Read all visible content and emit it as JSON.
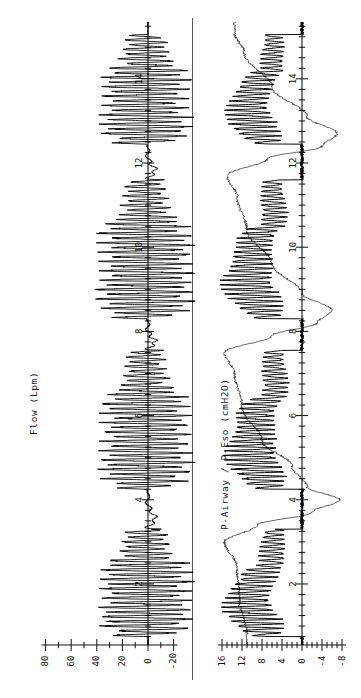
{
  "figure": {
    "orientation": "rotated-90-ccw",
    "background": "#ffffff",
    "ink_color": "#000000"
  },
  "panels": {
    "flow": {
      "axis_title": "Flow (Lpm)",
      "value_ticks": [
        "80",
        "60",
        "40",
        "20",
        "0",
        "-20"
      ],
      "time_ticks": [
        "2",
        "4",
        "6",
        "8",
        "10",
        "12",
        "14"
      ]
    },
    "pressure": {
      "axis_title": "P-Airway / P-Eso (cmH2O)",
      "value_ticks": [
        "16",
        "12",
        "8",
        "4",
        "0",
        "-4",
        "-8"
      ],
      "time_ticks": [
        "2",
        "4",
        "6",
        "8",
        "10",
        "12",
        "14"
      ]
    }
  },
  "chart_data": {
    "type": "line",
    "title": "",
    "subtitle": "",
    "layout": "two stacked panels, rendered rotated 90 degrees counter-clockwise; time axis runs bottom-to-top",
    "xlabel": "Time (s)",
    "xlim": [
      0.6,
      15.2
    ],
    "grid": false,
    "legend_position": "none",
    "panels": [
      {
        "name": "flow",
        "ylabel": "Flow (Lpm)",
        "yunits": "Lpm",
        "ylim": [
          -25,
          90
        ],
        "ytick_values": [
          80,
          60,
          40,
          20,
          0,
          -20
        ],
        "ytick_labels": [
          "80",
          "60",
          "40",
          "20",
          "0",
          "-20"
        ],
        "yminor_step": 10,
        "xtick_values": [
          2,
          4,
          6,
          8,
          10,
          12,
          14
        ],
        "xtick_labels": [
          "2",
          "4",
          "6",
          "8",
          "10",
          "12",
          "14"
        ],
        "xminor_step": 0.25,
        "series": [
          {
            "name": "Flow",
            "style": "solid",
            "linewidth": 0.9,
            "description": "high-frequency oscillatory flow; four oscillation bursts separated by quiet baseline intervals with transient spikes",
            "bursts": [
              {
                "t_start": 0.75,
                "t_end": 3.3,
                "carrier_hz": 9.0,
                "amp_low": 34,
                "amp_high": 76,
                "offset": 2
              },
              {
                "t_start": 4.25,
                "t_end": 7.55,
                "carrier_hz": 9.0,
                "amp_low": 30,
                "amp_high": 74,
                "offset": 2
              },
              {
                "t_start": 8.3,
                "t_end": 11.6,
                "carrier_hz": 9.0,
                "amp_low": 32,
                "amp_high": 78,
                "offset": 2
              },
              {
                "t_start": 12.45,
                "t_end": 15.05,
                "carrier_hz": 9.0,
                "amp_low": 34,
                "amp_high": 72,
                "offset": 2
              }
            ],
            "quiet_segments": [
              {
                "t_start": 3.3,
                "t_end": 4.25,
                "baseline": 0,
                "features": "slow downward excursion to about -6 then recovery with a sharp negative spike near t=4.1"
              },
              {
                "t_start": 7.55,
                "t_end": 8.3,
                "baseline": 0,
                "features": "brief ripple around -4 to +6 with a sharp spike at t=7.6"
              },
              {
                "t_start": 11.6,
                "t_end": 12.45,
                "baseline": 0,
                "features": "oscillatory decay from +10 to 0, sharp spike near t=12.4"
              }
            ]
          }
        ]
      },
      {
        "name": "pressure",
        "ylabel": "P-Airway / P-Eso (cmH2O)",
        "yunits": "cmH2O",
        "ylim": [
          -10,
          18
        ],
        "ytick_values": [
          16,
          12,
          8,
          4,
          0,
          -4,
          -8
        ],
        "ytick_labels": [
          "16",
          "12",
          "8",
          "4",
          "0",
          "-4",
          "-8"
        ],
        "yminor_step": 1,
        "xtick_values": [
          2,
          4,
          6,
          8,
          10,
          12,
          14
        ],
        "xtick_labels": [
          "2",
          "4",
          "6",
          "8",
          "10",
          "12",
          "14"
        ],
        "xminor_step": 0.25,
        "series": [
          {
            "name": "P-Airway",
            "style": "solid-thick",
            "linewidth": 1.0,
            "description": "high-frequency oscillating airway pressure riding on a mean plateau of about 10 cmH2O during bursts, dropping to 0 between bursts",
            "bursts": [
              {
                "t_start": 0.75,
                "t_end": 3.3,
                "carrier_hz": 9.0,
                "mean": 10.5,
                "amp": 5.0
              },
              {
                "t_start": 4.25,
                "t_end": 7.55,
                "carrier_hz": 9.0,
                "mean": 10.0,
                "amp": 5.0
              },
              {
                "t_start": 8.3,
                "t_end": 11.6,
                "carrier_hz": 9.0,
                "mean": 10.5,
                "amp": 5.0
              },
              {
                "t_start": 12.45,
                "t_end": 15.05,
                "carrier_hz": 9.0,
                "mean": 10.5,
                "amp": 4.5
              }
            ]
          },
          {
            "name": "P-Eso",
            "style": "solid-thin",
            "linewidth": 0.6,
            "description": "smooth esophageal pressure trace; slow rise to about 14-16 cmH2O during each burst and deep negative deflection to about -8 cmH2O between bursts",
            "key_points": [
              {
                "t": 0.8,
                "value": 11.0
              },
              {
                "t": 1.6,
                "value": 12.5
              },
              {
                "t": 2.4,
                "value": 13.0
              },
              {
                "t": 3.0,
                "value": 15.5
              },
              {
                "t": 3.4,
                "value": 9.0
              },
              {
                "t": 3.7,
                "value": -2.0
              },
              {
                "t": 4.0,
                "value": -7.5
              },
              {
                "t": 4.3,
                "value": -1.0
              },
              {
                "t": 4.8,
                "value": 2.0
              },
              {
                "t": 5.4,
                "value": 8.0
              },
              {
                "t": 6.2,
                "value": 12.0
              },
              {
                "t": 7.0,
                "value": 13.5
              },
              {
                "t": 7.5,
                "value": 15.5
              },
              {
                "t": 7.9,
                "value": 6.0
              },
              {
                "t": 8.2,
                "value": -3.0
              },
              {
                "t": 8.5,
                "value": -6.0
              },
              {
                "t": 8.9,
                "value": 0.0
              },
              {
                "t": 9.6,
                "value": 6.0
              },
              {
                "t": 10.4,
                "value": 11.0
              },
              {
                "t": 11.2,
                "value": 13.0
              },
              {
                "t": 11.7,
                "value": 15.0
              },
              {
                "t": 12.1,
                "value": 7.0
              },
              {
                "t": 12.4,
                "value": -4.0
              },
              {
                "t": 12.7,
                "value": -7.0
              },
              {
                "t": 13.1,
                "value": -1.0
              },
              {
                "t": 13.8,
                "value": 6.0
              },
              {
                "t": 14.6,
                "value": 11.5
              },
              {
                "t": 15.1,
                "value": 13.5
              }
            ]
          }
        ]
      }
    ]
  }
}
